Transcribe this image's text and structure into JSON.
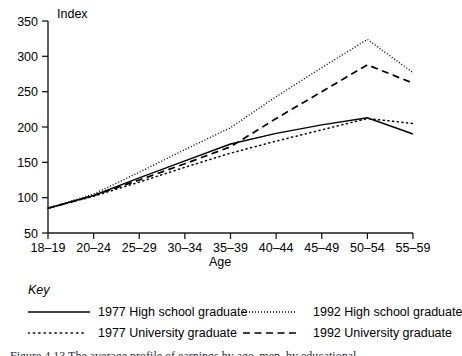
{
  "figure": {
    "y_axis_title": "Index",
    "x_axis_title": "Age",
    "key_title": "Key",
    "caption": "Figure 4.13   The average profile of earnings by age, men, by educational"
  },
  "legend": {
    "entries": [
      {
        "label": "1977 High school graduate",
        "style": "solid",
        "swatch": "solid-line-swatch"
      },
      {
        "label": "1992 High school graduate",
        "style": "fine-dotted",
        "swatch": "fine-dotted-line-swatch"
      },
      {
        "label": "1977 University graduate",
        "style": "dotted",
        "swatch": "dotted-line-swatch"
      },
      {
        "label": "1992 University graduate",
        "style": "dashed",
        "swatch": "dashed-line-swatch"
      }
    ]
  },
  "chart_data": {
    "type": "line",
    "title": "",
    "xlabel": "Age",
    "ylabel": "Index",
    "ylim": [
      50,
      350
    ],
    "yticks": [
      50,
      100,
      150,
      200,
      250,
      300,
      350
    ],
    "grid": false,
    "legend_position": "below-plot",
    "categories": [
      "18–19",
      "20–24",
      "25–29",
      "30–34",
      "35–39",
      "40–44",
      "45–49",
      "50–54",
      "55–59"
    ],
    "series": [
      {
        "name": "1977 High school graduate",
        "style": "solid",
        "values": [
          85,
          103,
          128,
          152,
          176,
          191,
          203,
          213,
          190
        ]
      },
      {
        "name": "1977 University graduate",
        "style": "dotted",
        "values": [
          85,
          102,
          122,
          143,
          163,
          180,
          196,
          212,
          205
        ]
      },
      {
        "name": "1992 High school graduate",
        "style": "fine-dotted",
        "values": [
          85,
          105,
          136,
          168,
          199,
          243,
          284,
          324,
          277
        ]
      },
      {
        "name": "1992 University graduate",
        "style": "dashed",
        "values": [
          85,
          103,
          125,
          148,
          172,
          212,
          250,
          288,
          262
        ]
      }
    ]
  }
}
